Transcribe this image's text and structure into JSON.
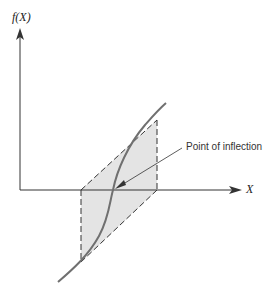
{
  "diagram": {
    "y_axis_label": "f(X)",
    "x_axis_label": "X",
    "annotation": "Point of inflection",
    "colors": {
      "axis": "#333333",
      "curve": "#707070",
      "shade": "#e4e4e4",
      "dashed": "#333333"
    }
  }
}
